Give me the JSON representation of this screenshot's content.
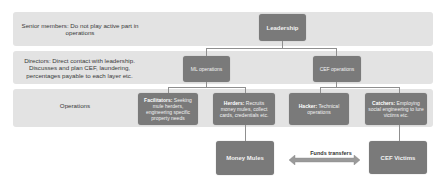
{
  "bands": [
    {
      "label": "Senior members: Do not play active part in operations"
    },
    {
      "label": "Directors: Direct contact with leadership. Discusses and plan CEF, laundering, percentages payable to each layer etc."
    },
    {
      "label": "Operations"
    }
  ],
  "nodes": {
    "leadership": "Leadership",
    "ml_operations": "ML operations",
    "cef_operations": "CEF operations",
    "facilitators": {
      "title": "Facilitators:",
      "desc": "Seeking mule herders, engineering specific property needs"
    },
    "herders": {
      "title": "Herders:",
      "desc": "Recruits money mules, collect cards, credentials etc."
    },
    "hacker": {
      "title": "Hacker:",
      "desc": "Technical operations"
    },
    "catchers": {
      "title": "Catchers:",
      "desc": "Employing social engineering to lure victims etc."
    },
    "money_mules": "Money Mules",
    "cef_victims": "CEF Victims"
  },
  "edge_labels": {
    "funds_transfers": "Funds transfers"
  },
  "colors": {
    "band": "#e3e3e3",
    "node": "#7a7a7a",
    "connector": "#8f8f8f"
  }
}
